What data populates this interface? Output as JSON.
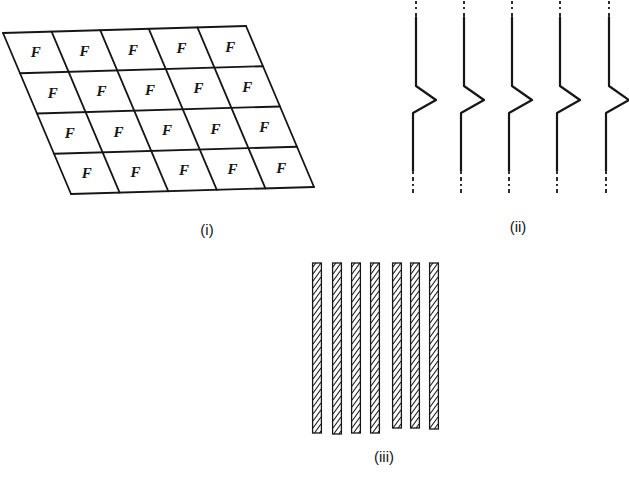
{
  "figure": {
    "background": "#ffffff",
    "ink": "#161616",
    "panels": [
      {
        "id": "panel-i",
        "label": "(i)",
        "type": "sheared-grid",
        "rows": 4,
        "cols": 5,
        "cell_letter": "F",
        "corners": {
          "top_left": [
            3,
            33
          ],
          "top_right": [
            246,
            26
          ],
          "bottom_left": [
            71,
            194
          ]
        },
        "grid_stroke_width": 1.8,
        "label_pos": [
          207,
          230
        ]
      },
      {
        "id": "panel-ii",
        "label": "(ii)",
        "type": "kinked-lines",
        "line_x": [
          416,
          464,
          512,
          560,
          609
        ],
        "top": 1,
        "dash_top_end": 17,
        "kink_top": 86,
        "kink_point_y": 100,
        "kink_dx": 20,
        "kink_bottom": 113,
        "lower_shift": -3,
        "solid_end": 171,
        "bottom": 193,
        "line_stroke_width": 2,
        "label_pos": [
          518,
          227
        ]
      },
      {
        "id": "panel-iii",
        "label": "(iii)",
        "type": "hatched-stripes",
        "stripes_x": [
          312,
          332,
          351,
          370,
          392,
          410,
          429
        ],
        "stripe_width": 10,
        "stripe_top": 263,
        "stripe_bottoms": [
          433,
          434,
          433,
          433,
          428,
          428,
          429
        ],
        "hatch_step": 7,
        "hatch_rise": 11,
        "stripe_stroke_width": 1.3,
        "label_pos": [
          384,
          457
        ]
      }
    ]
  }
}
